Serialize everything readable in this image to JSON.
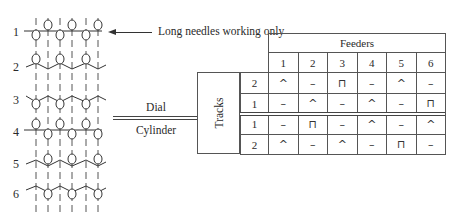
{
  "diagram": {
    "rows": [
      "1",
      "2",
      "3",
      "4",
      "5",
      "6"
    ],
    "note": "Long needles working only",
    "arrow_icon": "left-arrow",
    "dial_label": "Dial",
    "cylinder_label": "Cylinder"
  },
  "table": {
    "header": "Feeders",
    "tracks_label": "Tracks",
    "feeders": [
      "1",
      "2",
      "3",
      "4",
      "5",
      "6"
    ],
    "dial_rows": [
      {
        "track": "2",
        "cells": [
          "^",
          "–",
          "⊓",
          "–",
          "^",
          "–"
        ]
      },
      {
        "track": "1",
        "cells": [
          "–",
          "^",
          "–",
          "^",
          "–",
          "⊓"
        ]
      }
    ],
    "cylinder_rows": [
      {
        "track": "1",
        "cells": [
          "–",
          "⊓",
          "–",
          "^",
          "–",
          "^"
        ]
      },
      {
        "track": "2",
        "cells": [
          "^",
          "–",
          "^",
          "–",
          "⊓",
          "–"
        ]
      }
    ],
    "legend_symbols": {
      "^": "knit",
      "–": "miss",
      "⊓": "tuck"
    }
  }
}
